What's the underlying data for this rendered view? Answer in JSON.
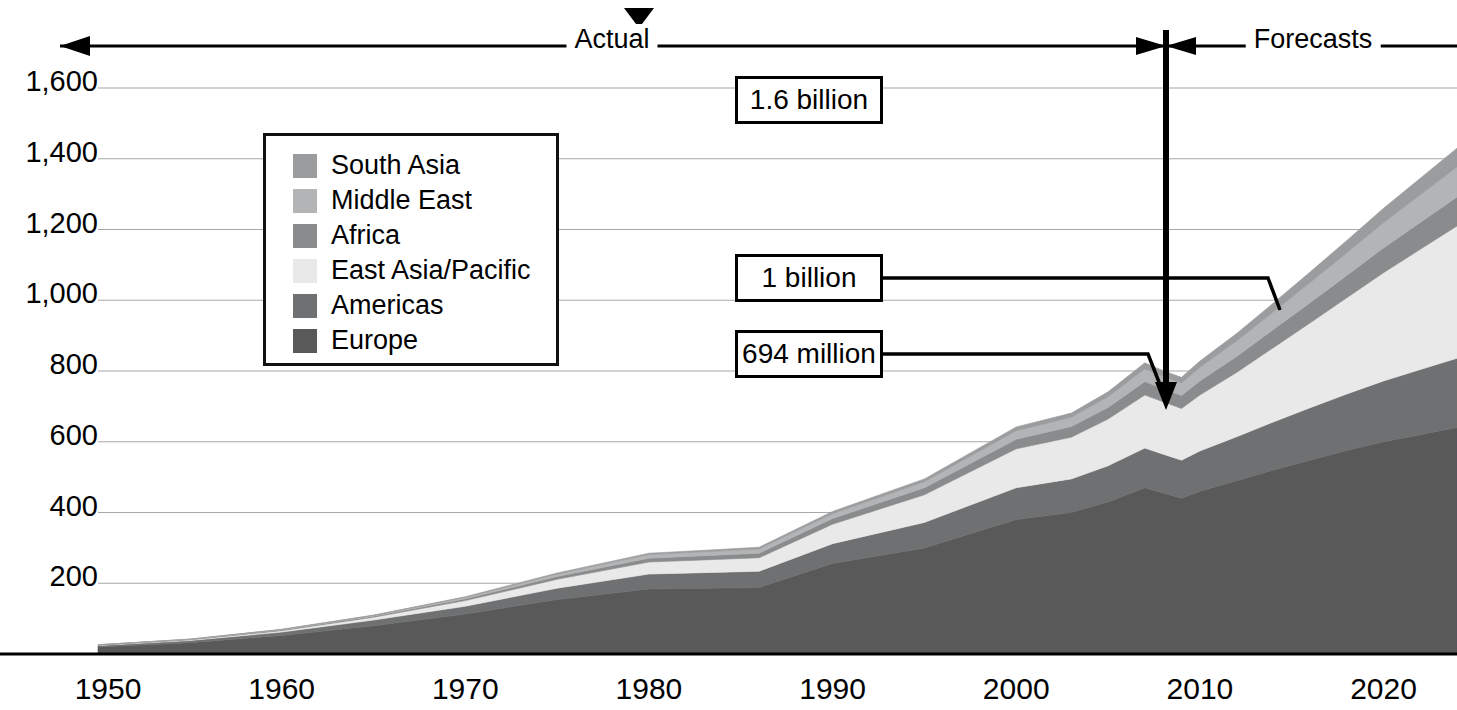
{
  "chart_data": {
    "type": "area",
    "stacked": true,
    "title": "",
    "xlabel": "",
    "ylabel": "",
    "xlim": [
      1950,
      2024
    ],
    "ylim": [
      0,
      1700
    ],
    "ytick_values": [
      200,
      400,
      600,
      800,
      1000,
      1200,
      1400,
      1600
    ],
    "ytick_labels": [
      "200",
      "400",
      "600",
      "800",
      "1,000",
      "1,200",
      "1,400",
      "1,600"
    ],
    "xtick_values": [
      1950,
      1960,
      1970,
      1980,
      1990,
      2000,
      2010,
      2020
    ],
    "xtick_labels": [
      "1950",
      "1960",
      "1970",
      "1980",
      "1990",
      "2000",
      "2010",
      "2020"
    ],
    "grid": "horizontal",
    "legend_position": "upper-left-inset",
    "x": [
      1950,
      1955,
      1960,
      1965,
      1970,
      1975,
      1980,
      1983,
      1986,
      1990,
      1995,
      2000,
      2003,
      2005,
      2007,
      2008,
      2009,
      2010,
      2012,
      2014,
      2016,
      2018,
      2020,
      2022,
      2024
    ],
    "series": [
      {
        "name": "Europe",
        "color": "#59595a",
        "values": [
          20,
          32,
          52,
          80,
          113,
          154,
          184,
          186,
          188,
          256,
          300,
          380,
          400,
          430,
          470,
          455,
          440,
          460,
          490,
          520,
          548,
          575,
          600,
          620,
          640
        ]
      },
      {
        "name": "Americas",
        "color": "#6f7071",
        "values": [
          4,
          6,
          10,
          16,
          22,
          32,
          42,
          44,
          46,
          56,
          72,
          90,
          95,
          102,
          112,
          110,
          108,
          114,
          124,
          136,
          148,
          160,
          172,
          184,
          196
        ]
      },
      {
        "name": "East Asia/Pacific",
        "color": "#e9e9e9",
        "values": [
          1,
          2,
          4,
          8,
          16,
          25,
          34,
          36,
          38,
          55,
          78,
          110,
          118,
          132,
          150,
          148,
          146,
          158,
          182,
          210,
          240,
          272,
          306,
          340,
          374
        ]
      },
      {
        "name": "Africa",
        "color": "#8a8b8c",
        "values": [
          1,
          1,
          2,
          3,
          5,
          8,
          11,
          12,
          13,
          16,
          20,
          27,
          30,
          33,
          38,
          37,
          37,
          40,
          45,
          51,
          57,
          63,
          70,
          76,
          82
        ]
      },
      {
        "name": "Middle East",
        "color": "#b3b4b5",
        "values": [
          0,
          1,
          1,
          2,
          4,
          7,
          10,
          11,
          12,
          14,
          17,
          24,
          26,
          30,
          36,
          35,
          35,
          38,
          44,
          50,
          57,
          64,
          71,
          78,
          85
        ]
      },
      {
        "name": "South Asia",
        "color": "#9b9c9d",
        "values": [
          0,
          0,
          1,
          1,
          2,
          3,
          4,
          4,
          5,
          6,
          8,
          11,
          12,
          14,
          17,
          16,
          16,
          18,
          21,
          25,
          30,
          35,
          41,
          47,
          53
        ]
      }
    ],
    "legend_entries": [
      {
        "label": "South Asia",
        "color": "#9b9c9d"
      },
      {
        "label": "Middle East",
        "color": "#b3b4b5"
      },
      {
        "label": "Africa",
        "color": "#8a8b8c"
      },
      {
        "label": "East Asia/Pacific",
        "color": "#e9e9e9"
      },
      {
        "label": "Americas",
        "color": "#6f7071"
      },
      {
        "label": "Europe",
        "color": "#59595a"
      }
    ],
    "annotations": [
      {
        "name": "actual-period",
        "text": "Actual",
        "x_center": 612
      },
      {
        "name": "forecasts-period",
        "text": "Forecasts",
        "x_center": 1313
      },
      {
        "name": "callout-1-6-billion",
        "text": "1.6 billion"
      },
      {
        "name": "callout-1-billion",
        "text": "1 billion"
      },
      {
        "name": "callout-694-million",
        "text": "694 million"
      }
    ],
    "divider_year": 2008
  }
}
